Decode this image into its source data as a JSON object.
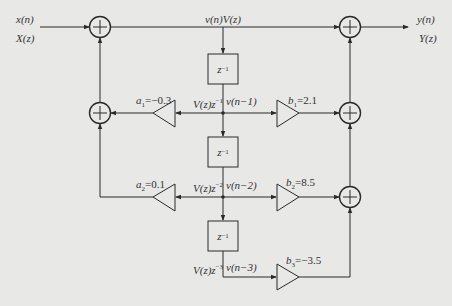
{
  "diagram": {
    "type": "IIR direct-form II signal flow graph",
    "input": {
      "time": "x(n)",
      "freq": "X(z)"
    },
    "output": {
      "time": "y(n)",
      "freq": "Y(z)"
    },
    "center_signal": "v(n)V(z)",
    "delay_label": "z",
    "delay_exp": "−1",
    "taps": [
      {
        "z_label": "V(z)z",
        "z_exp": "−1",
        "n_label": "v(n−1)"
      },
      {
        "z_label": "V(z)z",
        "z_exp": "−2",
        "n_label": "v(n−2)"
      },
      {
        "z_label": "V(z)z",
        "z_exp": "−3",
        "n_label": "v(n−3)"
      }
    ],
    "feedback": [
      {
        "name": "a",
        "sub": "1",
        "value": "=−0.3"
      },
      {
        "name": "a",
        "sub": "2",
        "value": "=0.1"
      }
    ],
    "feedforward": [
      {
        "name": "b",
        "sub": "1",
        "value": "=2.1"
      },
      {
        "name": "b",
        "sub": "2",
        "value": "=8.5"
      },
      {
        "name": "b",
        "sub": "3",
        "value": "=−3.5"
      }
    ],
    "colors": {
      "line": "#2a2a2a",
      "background": "#e8e8e7"
    }
  }
}
